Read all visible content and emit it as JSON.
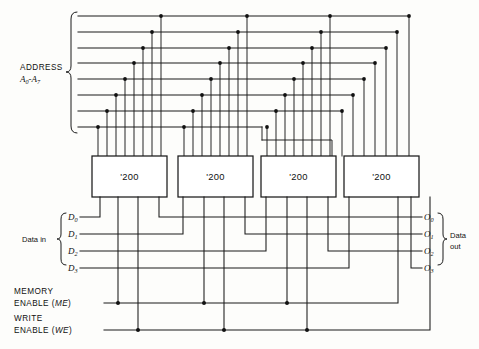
{
  "figure": {
    "chip_label": "'200",
    "chip_count": 4,
    "ink_color": "#1a1a1a",
    "background_color": "#fdfdfb"
  },
  "address_bus": {
    "label_line1": "ADDRESS",
    "label_line2_prefix": "A",
    "label_line2_sub1": "0",
    "label_line2_dash": "-",
    "label_line2_prefix2": "A",
    "label_line2_sub2": "7",
    "label_combined": "A0-A7",
    "line_count": 8,
    "signals": [
      "A0",
      "A1",
      "A2",
      "A3",
      "A4",
      "A5",
      "A6",
      "A7"
    ]
  },
  "data_in": {
    "group_label": "Data in",
    "signals": [
      {
        "name": "D",
        "sub": "0"
      },
      {
        "name": "D",
        "sub": "1"
      },
      {
        "name": "D",
        "sub": "2"
      },
      {
        "name": "D",
        "sub": "3"
      }
    ]
  },
  "data_out": {
    "group_label_line1": "Data",
    "group_label_line2": "out",
    "signals": [
      {
        "name": "O",
        "sub": "0"
      },
      {
        "name": "O",
        "sub": "1"
      },
      {
        "name": "O",
        "sub": "2"
      },
      {
        "name": "O",
        "sub": "3"
      }
    ]
  },
  "control": {
    "memory_enable": {
      "line1": "MEMORY",
      "line2_text": "ENABLE (",
      "line2_abbr": "ME",
      "line2_close": ")"
    },
    "write_enable": {
      "line1": "WRITE",
      "line2_text": "ENABLE (",
      "line2_abbr": "WE",
      "line2_close": ")"
    }
  },
  "chips": [
    {
      "label": "'200",
      "index": 1
    },
    {
      "label": "'200",
      "index": 2
    },
    {
      "label": "'200",
      "index": 3
    },
    {
      "label": "'200",
      "index": 4
    }
  ]
}
